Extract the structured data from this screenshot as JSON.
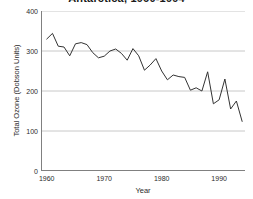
{
  "chart_data": {
    "type": "line",
    "title": "Antarctica, 1960-1994",
    "xlabel": "Year",
    "ylabel": "Total Ozone (Dobson Units)",
    "xlim": [
      1959,
      1994.5
    ],
    "ylim": [
      0,
      400
    ],
    "grid": "horizontal",
    "legend": "none",
    "series_color": "#333333",
    "gridline_color": "#c8c8c8",
    "axis_color": "#808080",
    "background_color": "#ffffff",
    "y_ticks": [
      400,
      300,
      200,
      100,
      0
    ],
    "x_ticks": [
      1960,
      1970,
      1980,
      1990
    ],
    "series": [
      {
        "name": "Total Ozone",
        "x": [
          1960,
          1961,
          1962,
          1963,
          1964,
          1965,
          1966,
          1967,
          1968,
          1969,
          1970,
          1971,
          1972,
          1973,
          1974,
          1975,
          1976,
          1977,
          1978,
          1979,
          1980,
          1981,
          1982,
          1983,
          1984,
          1985,
          1986,
          1987,
          1988,
          1989,
          1990,
          1991,
          1992,
          1993,
          1994
        ],
        "values": [
          330,
          344,
          312,
          310,
          288,
          318,
          321,
          316,
          296,
          283,
          287,
          300,
          305,
          294,
          277,
          306,
          288,
          252,
          265,
          281,
          250,
          228,
          240,
          236,
          234,
          202,
          208,
          200,
          248,
          168,
          178,
          230,
          155,
          175,
          124
        ],
        "y_first": 330,
        "y_last": 124,
        "y_max": 344,
        "y_min": 118
      }
    ]
  },
  "axes": {
    "y_tick_labels": [
      "400",
      "300",
      "200",
      "100",
      "0"
    ],
    "x_tick_labels": [
      "1960",
      "1970",
      "1980",
      "1990"
    ]
  }
}
